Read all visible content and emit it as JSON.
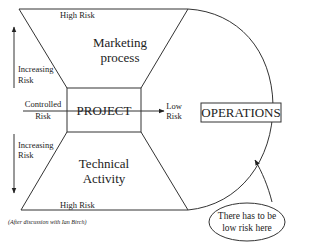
{
  "diagram": {
    "top_label": "High Risk",
    "bottom_label": "High Risk",
    "upper_region": {
      "line1": "Marketing",
      "line2": "process"
    },
    "lower_region": {
      "line1": "Technical",
      "line2": "Activity"
    },
    "center_box": "PROJECT",
    "left_labels": {
      "upper": {
        "line1": "Increasing",
        "line2": "Risk"
      },
      "middle": {
        "line1": "Controlled",
        "line2": "Risk"
      },
      "lower": {
        "line1": "Increasing",
        "line2": "Risk"
      }
    },
    "arrow_target_label": {
      "line1": "Low",
      "line2": "Risk"
    },
    "operations_box": "OPERATIONS",
    "callout": {
      "line1": "There has to be",
      "line2": "low risk here"
    },
    "footnote": "(After discussion with Ian Birch)",
    "colors": {
      "line": "#333333",
      "text": "#222222",
      "background": "#ffffff"
    }
  }
}
